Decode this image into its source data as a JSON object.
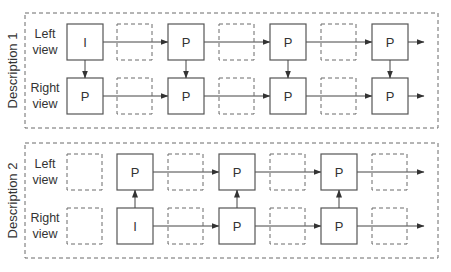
{
  "descriptions": [
    {
      "title": "Description 1",
      "rows": [
        {
          "label_line1": "Left",
          "label_line2": "view"
        },
        {
          "label_line1": "Right",
          "label_line2": "view"
        }
      ],
      "frames": [
        [
          "I",
          "",
          "P",
          "",
          "P",
          "",
          "P"
        ],
        [
          "P",
          "",
          "P",
          "",
          "P",
          "",
          "P"
        ]
      ],
      "inter_view_arrows": {
        "direction": "down",
        "columns": [
          0,
          2,
          4,
          6
        ]
      },
      "trailing_arrow": true
    },
    {
      "title": "Description 2",
      "rows": [
        {
          "label_line1": "Left",
          "label_line2": "view"
        },
        {
          "label_line1": "Right",
          "label_line2": "view"
        }
      ],
      "frames": [
        [
          "",
          "P",
          "",
          "P",
          "",
          "P",
          ""
        ],
        [
          "",
          "I",
          "",
          "P",
          "",
          "P",
          ""
        ]
      ],
      "inter_view_arrows": {
        "direction": "up",
        "columns": [
          1,
          3,
          5
        ]
      },
      "trailing_arrow": true
    }
  ]
}
